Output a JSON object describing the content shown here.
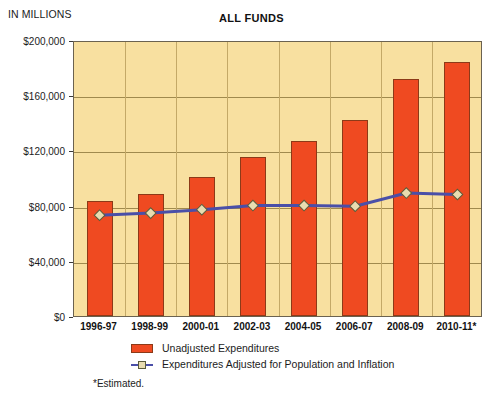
{
  "header": {
    "units_label": "IN MILLIONS",
    "title": "ALL FUNDS"
  },
  "footnote": "*Estimated.",
  "legend": {
    "position": "below-axis",
    "items": [
      {
        "label": "Unadjusted Expenditures",
        "type": "bar",
        "color": "#ef4a21"
      },
      {
        "label": "Expenditures Adjusted for Population and Inflation",
        "type": "line",
        "color": "#4a4fa8",
        "marker_color": "#e8dcb0"
      }
    ]
  },
  "colors": {
    "bar": "#ef4a21",
    "bar_border": "#8c3a18",
    "line": "#4a4fa8",
    "marker_fill": "#e8dcb0",
    "marker_border": "#5b5b3a",
    "plot_background": "#f8e0a0",
    "plot_border": "#6b6250",
    "gridline": "#a08a4e",
    "page_background": "#ffffff",
    "text": "#1c1c1c"
  },
  "chart_data": {
    "type": "bar",
    "title": "ALL FUNDS",
    "subtitle": "IN MILLIONS",
    "xlabel": "",
    "ylabel": "IN MILLIONS",
    "ylim": [
      0,
      200000
    ],
    "yticks": [
      0,
      40000,
      80000,
      120000,
      160000,
      200000
    ],
    "ytick_labels": [
      "$0",
      "$40,000",
      "$80,000",
      "$120,000",
      "$160,000",
      "$200,000"
    ],
    "grid": true,
    "categories": [
      "1996-97",
      "1998-99",
      "2000-01",
      "2002-03",
      "2004-05",
      "2006-07",
      "2008-09",
      "2010-11*"
    ],
    "series": [
      {
        "name": "Unadjusted Expenditures",
        "type": "bar",
        "values": [
          83000,
          88500,
          100500,
          115500,
          127000,
          142000,
          171500,
          184000
        ]
      },
      {
        "name": "Expenditures Adjusted for Population and Inflation",
        "type": "line",
        "values": [
          74500,
          76000,
          78500,
          81500,
          81500,
          81000,
          90500,
          89500
        ]
      }
    ]
  }
}
